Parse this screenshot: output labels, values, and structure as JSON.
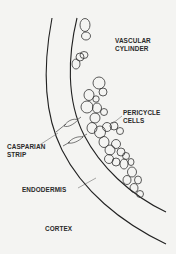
{
  "diagram": {
    "labels": {
      "vascular_cylinder": [
        "VASCULAR",
        "CYLINDER"
      ],
      "pericycle_cells": [
        "PERICYCLE",
        "CELLS"
      ],
      "casparian_strip": [
        "CASPARIAN",
        "STRIP"
      ],
      "endodermis": "ENDODERMIS",
      "cortex": "CORTEX"
    },
    "colors": {
      "background": "#f4f4f2",
      "line": "#222222",
      "text": "#2a2a2a"
    }
  }
}
